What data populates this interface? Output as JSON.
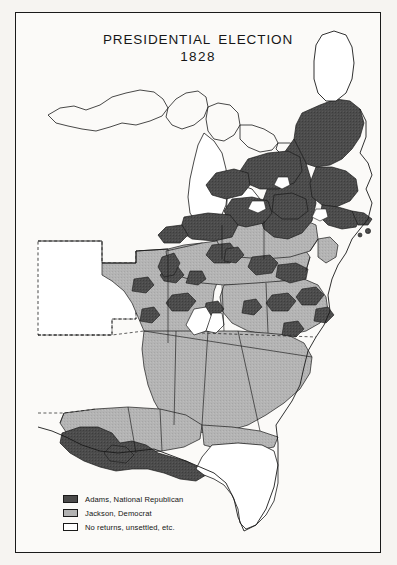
{
  "title": {
    "line1": "PRESIDENTIAL ELECTION",
    "line2": "1828"
  },
  "legend": {
    "items": [
      {
        "label": "Adams, National Republican",
        "color": "#4a4a4a",
        "swatch": "adams-swatch"
      },
      {
        "label": "Jackson, Democrat",
        "color": "#b2b2b2",
        "swatch": "jackson-swatch"
      },
      {
        "label": "No returns, unsettled, etc.",
        "color": "#ffffff",
        "swatch": "no-returns-swatch"
      }
    ]
  },
  "map": {
    "colors": {
      "adams": "#4a4a4a",
      "jackson": "#b2b2b2",
      "unsettled": "#ffffff",
      "outline": "#1a1a1a",
      "paper": "#fbfaf8",
      "frame": "#1a1a1a"
    },
    "regions": [
      {
        "name": "new-england",
        "result": "adams"
      },
      {
        "name": "northern-maine",
        "result": "unsettled"
      },
      {
        "name": "new-york",
        "result": "mixed"
      },
      {
        "name": "pennsylvania",
        "result": "jackson"
      },
      {
        "name": "ohio-valley",
        "result": "mixed"
      },
      {
        "name": "southeast",
        "result": "jackson"
      },
      {
        "name": "louisiana-delta",
        "result": "adams"
      },
      {
        "name": "florida-territory",
        "result": "unsettled"
      },
      {
        "name": "great-lakes-territory",
        "result": "unsettled"
      },
      {
        "name": "western-territories",
        "result": "unsettled"
      }
    ]
  }
}
